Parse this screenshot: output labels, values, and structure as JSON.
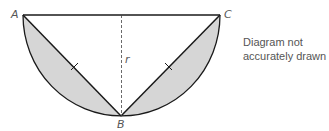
{
  "diagram": {
    "points": {
      "A": {
        "label": "A",
        "x": 23,
        "y": 15
      },
      "B": {
        "label": "B",
        "x": 121,
        "y": 116
      },
      "C": {
        "label": "C",
        "x": 220,
        "y": 15
      }
    },
    "radius_label": "r",
    "shape": "semicircle with inscribed triangle ABC; shaded segments between chords AB, BC and arc",
    "equal_marks": [
      "AB",
      "BC"
    ],
    "colors": {
      "shade": "#d9d9d9",
      "stroke": "#1a1a1a",
      "text": "#555555"
    }
  },
  "note": {
    "line1": "Diagram not",
    "line2": "accurately drawn"
  }
}
